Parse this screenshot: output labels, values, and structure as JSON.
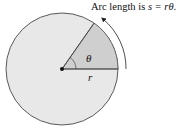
{
  "caption": {
    "prefix": "Arc length is ",
    "formula": "s = rθ",
    "suffix": "."
  },
  "labels": {
    "theta": "θ",
    "radius": "r"
  },
  "colors": {
    "circle_fill": "#e8e8e8",
    "sector_fill": "#cfcfcf",
    "stroke": "#333333"
  }
}
